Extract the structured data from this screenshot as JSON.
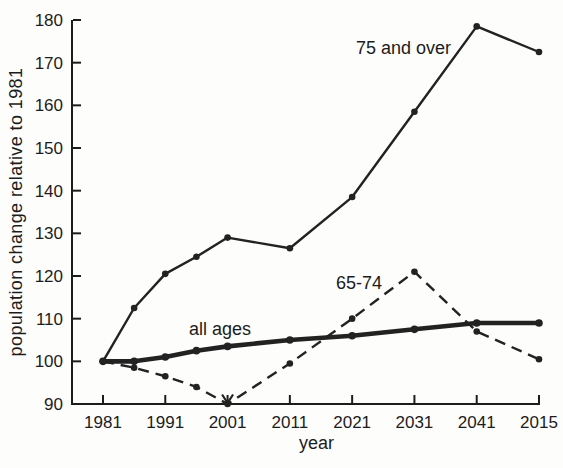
{
  "figure": {
    "background": "#fdfdfb",
    "ink": "#1c1c1c"
  },
  "chart_data": {
    "type": "line",
    "title": "",
    "xlabel": "year",
    "ylabel": "population change relative to 1981",
    "ylim": [
      90,
      180
    ],
    "grid": false,
    "legend_position": "inline-labels",
    "y_ticks": [
      90,
      100,
      110,
      120,
      130,
      140,
      150,
      160,
      170,
      180
    ],
    "x_tick_labels": [
      "1981",
      "1991",
      "2001",
      "2011",
      "2021",
      "2031",
      "2041",
      "2015"
    ],
    "x_tick_years": [
      1981,
      1991,
      2001,
      2011,
      2021,
      2031,
      2041,
      2051
    ],
    "x": [
      1981,
      1986,
      1991,
      1996,
      2001,
      2011,
      2021,
      2031,
      2041,
      2051
    ],
    "series": [
      {
        "name": "75 and over",
        "style": "solid-thin",
        "values": [
          100,
          112.5,
          120.5,
          124.5,
          129,
          126.5,
          138.5,
          158.5,
          178.5,
          172.5
        ]
      },
      {
        "name": "all ages",
        "style": "solid-thick",
        "values": [
          100,
          100,
          101,
          102.5,
          103.5,
          105,
          106,
          107.5,
          109,
          109
        ]
      },
      {
        "name": "65-74",
        "style": "dashed",
        "values": [
          100,
          98.5,
          96.5,
          94,
          90,
          99.5,
          110,
          121,
          107,
          100.5
        ],
        "annotation": {
          "type": "down-arrow",
          "x": 2001,
          "value": 90
        }
      }
    ]
  }
}
